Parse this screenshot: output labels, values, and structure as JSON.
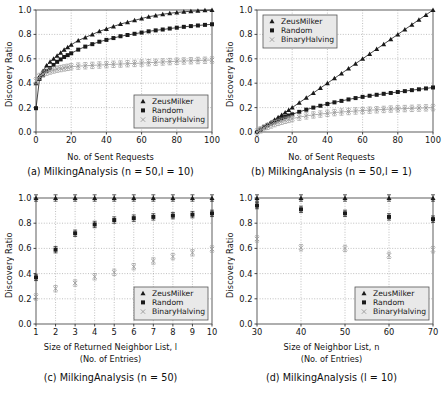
{
  "figure": {
    "background": "#ffffff",
    "series_colors": {
      "ZeusMilker": "#1a1a1a",
      "Random": "#1a1a1a",
      "BinaryHalving": "#9a9a9a"
    },
    "legend_entries": [
      "ZeusMilker",
      "Random",
      "BinaryHalving"
    ],
    "legend_markers": [
      "triangle",
      "square",
      "x"
    ]
  },
  "panels": {
    "a": {
      "caption": "(a)  MilkingAnalysis (n = 50,l = 10)",
      "xlabel": "No. of Sent Requests",
      "ylabel": "Discovery Ratio",
      "legend_position": "lower-right"
    },
    "b": {
      "caption": "(b)  MilkingAnalysis (n = 50,l = 1)",
      "xlabel": "No. of Sent Requests",
      "ylabel": "Discovery Ratio",
      "legend_position": "upper-left"
    },
    "c": {
      "caption": "(c)  MilkingAnalysis (n = 50)",
      "xlabel": "Size of Returned Neighbor List, l",
      "xlabel2": "(No. of Entries)",
      "ylabel": "Discovery Ratio",
      "legend_position": "lower-right"
    },
    "d": {
      "caption": "(d)  MilkingAnalysis (l = 10)",
      "xlabel": "Size of Neighbor List, n",
      "xlabel2": "(No. of Entries)",
      "ylabel": "Discovery Ratio",
      "legend_position": "lower-right"
    }
  },
  "chart_data": [
    {
      "type": "line",
      "panel": "a",
      "title": "(a)  MilkingAnalysis (n = 50,l = 10)",
      "xlabel": "No. of Sent Requests",
      "ylabel": "Discovery Ratio",
      "xlim": [
        0,
        100
      ],
      "ylim": [
        0.0,
        1.0
      ],
      "xticks": [
        0,
        20,
        40,
        60,
        80,
        100
      ],
      "yticks": [
        0.0,
        0.2,
        0.4,
        0.6,
        0.8,
        1.0
      ],
      "grid": true,
      "legend": [
        "ZeusMilker",
        "Random",
        "BinaryHalving"
      ],
      "x": [
        0,
        2,
        4,
        6,
        8,
        10,
        12,
        14,
        16,
        18,
        20,
        24,
        28,
        32,
        36,
        40,
        44,
        48,
        52,
        56,
        60,
        64,
        68,
        72,
        76,
        80,
        84,
        88,
        92,
        96,
        100
      ],
      "series": [
        {
          "name": "ZeusMilker",
          "marker": "triangle",
          "values": [
            0.4,
            0.46,
            0.5,
            0.545,
            0.575,
            0.6,
            0.625,
            0.65,
            0.675,
            0.695,
            0.715,
            0.75,
            0.775,
            0.8,
            0.825,
            0.845,
            0.865,
            0.885,
            0.9,
            0.915,
            0.93,
            0.945,
            0.955,
            0.965,
            0.973,
            0.98,
            0.985,
            0.99,
            0.993,
            0.997,
            1.0
          ]
        },
        {
          "name": "Random",
          "marker": "square",
          "values": [
            0.195,
            0.435,
            0.47,
            0.5,
            0.525,
            0.55,
            0.575,
            0.595,
            0.615,
            0.63,
            0.645,
            0.675,
            0.7,
            0.72,
            0.74,
            0.755,
            0.77,
            0.785,
            0.795,
            0.805,
            0.815,
            0.825,
            0.833,
            0.84,
            0.848,
            0.855,
            0.862,
            0.868,
            0.873,
            0.878,
            0.883
          ]
        },
        {
          "name": "BinaryHalving",
          "marker": "x",
          "values": [
            0.42,
            0.455,
            0.475,
            0.49,
            0.5,
            0.508,
            0.515,
            0.52,
            0.525,
            0.53,
            0.535,
            0.54,
            0.543,
            0.546,
            0.549,
            0.552,
            0.555,
            0.557,
            0.56,
            0.562,
            0.565,
            0.568,
            0.571,
            0.574,
            0.577,
            0.58,
            0.582,
            0.584,
            0.586,
            0.588,
            0.59
          ]
        }
      ]
    },
    {
      "type": "line",
      "panel": "b",
      "title": "(b)  MilkingAnalysis (n = 50,l = 1)",
      "xlabel": "No. of Sent Requests",
      "ylabel": "Discovery Ratio",
      "xlim": [
        0,
        100
      ],
      "ylim": [
        0.0,
        1.0
      ],
      "xticks": [
        0,
        20,
        40,
        60,
        80,
        100
      ],
      "yticks": [
        0.0,
        0.2,
        0.4,
        0.6,
        0.8,
        1.0
      ],
      "grid": true,
      "legend": [
        "ZeusMilker",
        "Random",
        "BinaryHalving"
      ],
      "x": [
        0,
        2,
        4,
        6,
        8,
        10,
        12,
        14,
        16,
        18,
        20,
        24,
        28,
        32,
        36,
        40,
        44,
        48,
        52,
        56,
        60,
        64,
        68,
        72,
        76,
        80,
        84,
        88,
        92,
        96,
        100
      ],
      "series": [
        {
          "name": "ZeusMilker",
          "marker": "triangle",
          "values": [
            0.0,
            0.02,
            0.04,
            0.06,
            0.08,
            0.1,
            0.12,
            0.14,
            0.16,
            0.18,
            0.2,
            0.24,
            0.28,
            0.32,
            0.36,
            0.4,
            0.44,
            0.48,
            0.52,
            0.56,
            0.6,
            0.64,
            0.68,
            0.72,
            0.76,
            0.8,
            0.84,
            0.88,
            0.92,
            0.96,
            1.0
          ]
        },
        {
          "name": "Random",
          "marker": "square",
          "values": [
            0.0,
            0.02,
            0.038,
            0.055,
            0.07,
            0.085,
            0.1,
            0.112,
            0.124,
            0.135,
            0.145,
            0.165,
            0.183,
            0.2,
            0.215,
            0.23,
            0.243,
            0.255,
            0.267,
            0.278,
            0.288,
            0.297,
            0.305,
            0.313,
            0.32,
            0.328,
            0.335,
            0.343,
            0.35,
            0.357,
            0.365
          ]
        },
        {
          "name": "BinaryHalving",
          "marker": "x",
          "values": [
            0.0,
            0.018,
            0.033,
            0.046,
            0.058,
            0.069,
            0.079,
            0.088,
            0.096,
            0.103,
            0.11,
            0.122,
            0.132,
            0.14,
            0.147,
            0.153,
            0.159,
            0.164,
            0.168,
            0.172,
            0.176,
            0.179,
            0.182,
            0.185,
            0.188,
            0.19,
            0.192,
            0.194,
            0.196,
            0.198,
            0.2
          ]
        }
      ]
    },
    {
      "type": "scatter",
      "panel": "c",
      "title": "(c)  MilkingAnalysis (n = 50)",
      "xlabel": "Size of Returned Neighbor List, l (No. of Entries)",
      "ylabel": "Discovery Ratio",
      "xlim": [
        1,
        10
      ],
      "ylim": [
        0.0,
        1.0
      ],
      "xticks": [
        1,
        2,
        3,
        4,
        5,
        6,
        7,
        8,
        9,
        10
      ],
      "yticks": [
        0.0,
        0.2,
        0.4,
        0.6,
        0.8,
        1.0
      ],
      "grid": true,
      "legend": [
        "ZeusMilker",
        "Random",
        "BinaryHalving"
      ],
      "x": [
        1,
        2,
        3,
        4,
        5,
        6,
        7,
        8,
        9,
        10
      ],
      "series": [
        {
          "name": "ZeusMilker",
          "marker": "triangle",
          "values": [
            1.0,
            1.0,
            1.0,
            1.0,
            1.0,
            1.0,
            1.0,
            1.0,
            1.0,
            1.0
          ]
        },
        {
          "name": "Random",
          "marker": "square",
          "values": [
            0.37,
            0.59,
            0.72,
            0.79,
            0.825,
            0.84,
            0.85,
            0.86,
            0.868,
            0.878
          ]
        },
        {
          "name": "BinaryHalving",
          "marker": "x",
          "values": [
            0.215,
            0.28,
            0.325,
            0.375,
            0.41,
            0.455,
            0.5,
            0.535,
            0.565,
            0.595
          ]
        }
      ]
    },
    {
      "type": "scatter",
      "panel": "d",
      "title": "(d)  MilkingAnalysis (l = 10)",
      "xlabel": "Size of Neighbor List, n (No. of Entries)",
      "ylabel": "Discovery Ratio",
      "xlim": [
        30,
        70
      ],
      "ylim": [
        0.0,
        1.0
      ],
      "xticks": [
        30,
        40,
        50,
        60,
        70
      ],
      "yticks": [
        0.0,
        0.2,
        0.4,
        0.6,
        0.8,
        1.0
      ],
      "grid": true,
      "legend": [
        "ZeusMilker",
        "Random",
        "BinaryHalving"
      ],
      "x": [
        30,
        40,
        50,
        60,
        70
      ],
      "series": [
        {
          "name": "ZeusMilker",
          "marker": "triangle",
          "values": [
            1.0,
            1.0,
            1.0,
            1.0,
            1.0
          ]
        },
        {
          "name": "Random",
          "marker": "square",
          "values": [
            0.94,
            0.91,
            0.878,
            0.85,
            0.832
          ]
        },
        {
          "name": "BinaryHalving",
          "marker": "x",
          "values": [
            0.675,
            0.605,
            0.6,
            0.545,
            0.59
          ]
        }
      ]
    }
  ]
}
